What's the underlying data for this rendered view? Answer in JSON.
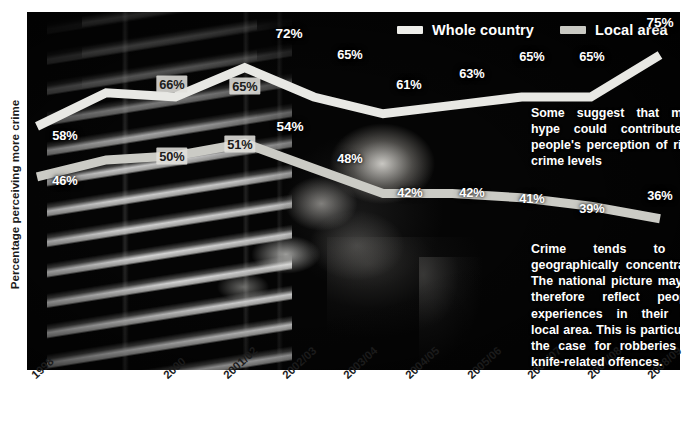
{
  "chart_data": {
    "type": "line",
    "title": "",
    "xlabel": "",
    "ylabel": "Percentage perceiving more crime",
    "ylim": [
      30,
      80
    ],
    "grid": false,
    "legend_position": "top-right",
    "categories": [
      "1998",
      "",
      "2000",
      "2001/02",
      "2002/03",
      "2003/04",
      "2004/05",
      "2005/06",
      "2006/07",
      "2007/08",
      "2008/09"
    ],
    "series": [
      {
        "name": "Whole country",
        "color": "#e8e8e4",
        "x": [
          "1998",
          "2000",
          "2001/02",
          "2002/03",
          "2003/04",
          "2004/05",
          "2005/06",
          "2006/07",
          "2007/08",
          "2008/09"
        ],
        "values": [
          58,
          66,
          65,
          72,
          65,
          61,
          63,
          65,
          65,
          75
        ]
      },
      {
        "name": "Local area",
        "color": "#cbcbc5",
        "x": [
          "1998",
          "2000",
          "2001/02",
          "2002/03",
          "2003/04",
          "2004/05",
          "2005/06",
          "2006/07",
          "2007/08",
          "2008/09"
        ],
        "values": [
          46,
          50,
          51,
          54,
          48,
          42,
          42,
          41,
          39,
          36
        ]
      }
    ],
    "annotations": [
      "Some suggest that media hype could contribute to people's perception of rising crime levels",
      "Crime tends to be geographically concentrated. The national picture may not therefore reflect people's experiences in their own local area. This is particularly the case for robberies and knife-related offences."
    ]
  },
  "legend": {
    "items": [
      {
        "label": "Whole country",
        "color": "#eeeeea"
      },
      {
        "label": "Local area",
        "color": "#c9c9c3"
      }
    ]
  },
  "axes": {
    "y_label": "Percentage perceiving more crime",
    "x_ticks": [
      "1998",
      "2000",
      "2001/02",
      "2002/03",
      "2003/04",
      "2004/05",
      "2005/06",
      "2006/07",
      "2007/08",
      "2008/09"
    ]
  },
  "labels": {
    "whole_country": [
      "58%",
      "66%",
      "65%",
      "72%",
      "65%",
      "61%",
      "63%",
      "65%",
      "65%",
      "75%"
    ],
    "local_area": [
      "46%",
      "50%",
      "51%",
      "54%",
      "48%",
      "42%",
      "42%",
      "41%",
      "39%",
      "36%"
    ]
  },
  "annotations": {
    "media": "Some suggest that media hype could contribute to people's perception of rising crime levels",
    "geography": "Crime tends to be geographically concentrated. The national picture may not therefore reflect people's experiences in their own local area. This is particularly the case for robberies and knife-related offences."
  },
  "colors": {
    "whole_country_line": "#e9e9e5",
    "local_area_line": "#c9c9c3",
    "background": "#000000",
    "text": "#ffffff",
    "axis_text": "#1b1b1b"
  }
}
